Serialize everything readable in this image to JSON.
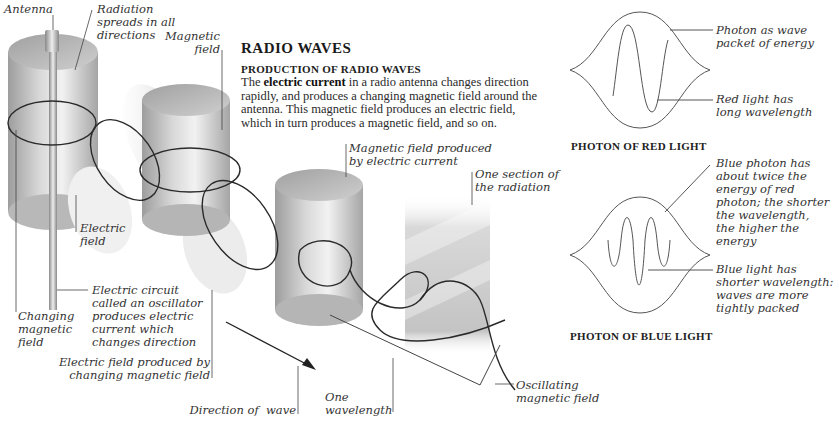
{
  "header": {
    "title": "RADIO WAVES",
    "subtitle": "PRODUCTION OF RADIO WAVES",
    "body_bold": "electric current",
    "body_prefix": "The ",
    "body_rest": " in a radio antenna changes direction rapidly, and produces a changing magnetic field around the antenna. This magnetic field produces an electric field, which in turn produces a magnetic field, and so on."
  },
  "labels": {
    "antenna": "Antenna",
    "radiation_spreads": "Radiation\nspreads in all\ndirections",
    "magnetic_field": "Magnetic\nfield",
    "electric_field": "Electric\nfield",
    "electric_circuit": "Electric circuit\ncalled an oscillator\nproduces electric\ncurrent which\nchanges direction",
    "changing_magnetic_field": "Changing\nmagnetic\nfield",
    "electric_field_produced": "Electric field produced by\nchanging magnetic field",
    "direction_of_wave": "Direction of  wave",
    "one_wavelength": "One\nwavelength",
    "magnetic_field_produced": "Magnetic field produced\nby electric current",
    "one_section": "One section of\nthe radiation",
    "oscillating_magnetic_field": "Oscillating\nmagnetic field"
  },
  "photons": {
    "red": {
      "caption": "PHOTON OF RED LIGHT",
      "label_packet": "Photon as wave\npacket of energy",
      "label_wavelength": "Red light has\nlong wavelength"
    },
    "blue": {
      "caption": "PHOTON OF BLUE LIGHT",
      "label_energy": "Blue photon has\nabout twice the\nenergy of red\nphoton; the shorter\nthe wavelength,\nthe higher the\nenergy",
      "label_wavelength": "Blue light has\nshorter wavelength:\nwaves are more\ntightly packed"
    }
  },
  "colors": {
    "background": "#ffffff",
    "text": "#222222",
    "line": "#333333",
    "cylinder_light": "#e6e6e6",
    "cylinder_dark": "#9a9a9a"
  }
}
